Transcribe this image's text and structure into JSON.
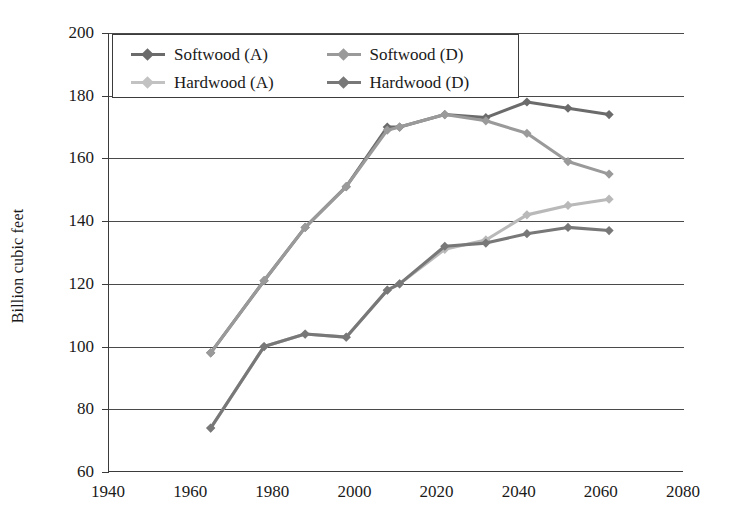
{
  "chart_data": {
    "type": "line",
    "title": "",
    "xlabel": "",
    "ylabel": "Billion cubic feet",
    "xlim": [
      1940,
      2080
    ],
    "ylim": [
      60,
      200
    ],
    "xticks": [
      1940,
      1960,
      1980,
      2000,
      2020,
      2040,
      2060,
      2080
    ],
    "yticks": [
      60,
      80,
      100,
      120,
      140,
      160,
      180,
      200
    ],
    "grid": "horizontal",
    "legend_position": "top-left-inside",
    "series": [
      {
        "name": "Softwood (A)",
        "color": "#6b6b6b",
        "x": [
          1965,
          1978,
          1988,
          1998,
          2008,
          2011,
          2022,
          2032,
          2042,
          2052,
          2062
        ],
        "y": [
          98,
          121,
          138,
          151,
          170,
          170,
          174,
          173,
          178,
          176,
          174
        ]
      },
      {
        "name": "Softwood (D)",
        "color": "#9a9a9a",
        "x": [
          1965,
          1978,
          1988,
          1998,
          2008,
          2011,
          2022,
          2032,
          2042,
          2052,
          2062
        ],
        "y": [
          98,
          121,
          138,
          151,
          169,
          170,
          174,
          172,
          168,
          159,
          155
        ]
      },
      {
        "name": "Hardwood (A)",
        "color": "#b9b9b9",
        "x": [
          1965,
          1978,
          1988,
          1998,
          2008,
          2011,
          2022,
          2032,
          2042,
          2052,
          2062
        ],
        "y": [
          74,
          100,
          104,
          103,
          118,
          120,
          131,
          134,
          142,
          145,
          147
        ]
      },
      {
        "name": "Hardwood (D)",
        "color": "#787878",
        "x": [
          1965,
          1978,
          1988,
          1998,
          2008,
          2011,
          2022,
          2032,
          2042,
          2052,
          2062
        ],
        "y": [
          74,
          100,
          104,
          103,
          118,
          120,
          132,
          133,
          136,
          138,
          137
        ]
      }
    ]
  },
  "legend": {
    "items": [
      {
        "label": "Softwood (A)",
        "color": "#6b6b6b"
      },
      {
        "label": "Softwood (D)",
        "color": "#9a9a9a"
      },
      {
        "label": "Hardwood (A)",
        "color": "#c2c2c2"
      },
      {
        "label": "Hardwood (D)",
        "color": "#787878"
      }
    ]
  },
  "axes": {
    "y_title": "Billion cubic feet",
    "y_tick_labels": [
      "200",
      "180",
      "160",
      "140",
      "120",
      "100",
      "80",
      "60"
    ],
    "x_tick_labels": [
      "1940",
      "1960",
      "1980",
      "2000",
      "2020",
      "2040",
      "2060",
      "2080"
    ]
  },
  "colors": {
    "axis": "#3b3b3b",
    "grid": "#4a4a4a",
    "background": "#ffffff"
  }
}
